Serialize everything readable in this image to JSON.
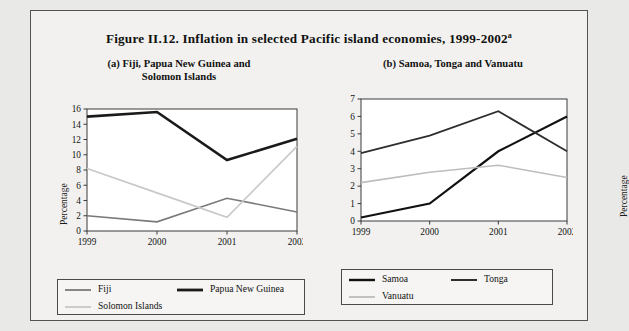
{
  "figure": {
    "title": "Figure II.12.  Inflation in selected Pacific island economies, 1999-2002",
    "title_superscript": "a"
  },
  "panel_a": {
    "subtitle_line1": "(a)  Fiji, Papua New Guinea and",
    "subtitle_line2": "Solomon Islands",
    "ylabel": "Percentage",
    "legend": [
      {
        "label": "Fiji",
        "color": "#7a7a7a",
        "width": 1.6
      },
      {
        "label": "Papua New Guinea",
        "color": "#1a1a1a",
        "width": 2.6
      },
      {
        "label": "Solomon Islands",
        "color": "#c8c8c8",
        "width": 1.6
      }
    ]
  },
  "panel_b": {
    "subtitle_line1": "(b)  Samoa, Tonga and Vanuatu",
    "subtitle_line2": "",
    "ylabel": "Percentage",
    "legend": [
      {
        "label": "Samoa",
        "color": "#111111",
        "width": 2.2
      },
      {
        "label": "Tonga",
        "color": "#2e2e2e",
        "width": 1.8
      },
      {
        "label": "Vanuatu",
        "color": "#bdbdbd",
        "width": 1.6
      }
    ]
  },
  "chart_data": [
    {
      "type": "line",
      "id": "panel-a",
      "title": "(a)  Fiji, Papua New Guinea and Solomon Islands",
      "xlabel": "",
      "ylabel": "Percentage",
      "categories": [
        "1999",
        "2000",
        "2001",
        "2002"
      ],
      "x": [
        1999,
        2000,
        2001,
        2002
      ],
      "ylim": [
        0,
        16
      ],
      "yticks": [
        0,
        2,
        4,
        6,
        8,
        10,
        12,
        14,
        16
      ],
      "grid": false,
      "legend_position": "bottom",
      "series": [
        {
          "name": "Fiji",
          "values": [
            2.0,
            1.2,
            4.3,
            2.5
          ],
          "color": "#7a7a7a",
          "width": 1.6
        },
        {
          "name": "Papua New Guinea",
          "values": [
            15.0,
            15.6,
            9.3,
            12.1
          ],
          "color": "#1a1a1a",
          "width": 2.6
        },
        {
          "name": "Solomon Islands",
          "values": [
            8.2,
            5.0,
            1.8,
            11.1
          ],
          "color": "#c8c8c8",
          "width": 1.6
        }
      ]
    },
    {
      "type": "line",
      "id": "panel-b",
      "title": "(b)  Samoa, Tonga and Vanuatu",
      "xlabel": "",
      "ylabel": "Percentage",
      "categories": [
        "1999",
        "2000",
        "2001",
        "2002"
      ],
      "x": [
        1999,
        2000,
        2001,
        2002
      ],
      "ylim": [
        0,
        7
      ],
      "yticks": [
        0,
        1,
        2,
        3,
        4,
        5,
        6,
        7
      ],
      "grid": false,
      "legend_position": "bottom",
      "series": [
        {
          "name": "Samoa",
          "values": [
            0.2,
            1.0,
            4.0,
            6.0
          ],
          "color": "#111111",
          "width": 2.2
        },
        {
          "name": "Tonga",
          "values": [
            3.9,
            4.9,
            6.3,
            4.0
          ],
          "color": "#2e2e2e",
          "width": 1.8
        },
        {
          "name": "Vanuatu",
          "values": [
            2.2,
            2.8,
            3.2,
            2.5
          ],
          "color": "#bdbdbd",
          "width": 1.6
        }
      ]
    }
  ]
}
